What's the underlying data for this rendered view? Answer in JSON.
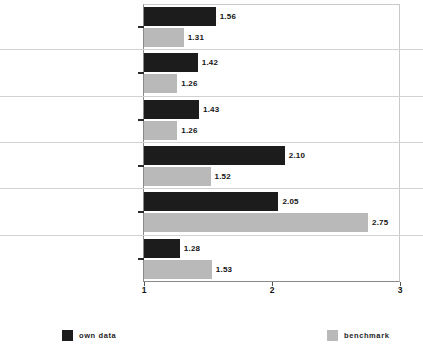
{
  "chart_data": {
    "type": "bar",
    "orientation": "horizontal",
    "title": "",
    "xlabel": "",
    "ylabel": "",
    "xlim": [
      1,
      3
    ],
    "xticks": [
      "1",
      "2",
      "3"
    ],
    "grid": false,
    "legend_position": "bottom",
    "categories": [
      "Satisfaction with the vacation",
      "Accommodation",
      "Culinary offers",
      "Sports offers",
      "Museums / sights",
      "Wellness / beauty / spa offers"
    ],
    "series": [
      {
        "name": "own data",
        "color": "#1c1c1c",
        "values": [
          1.56,
          1.42,
          1.43,
          2.1,
          2.05,
          1.28
        ],
        "labels": [
          "1.56",
          "1.42",
          "1.43",
          "2.10",
          "2.05",
          "1.28"
        ]
      },
      {
        "name": "benchmark",
        "color": "#b9b9b9",
        "values": [
          1.31,
          1.26,
          1.26,
          1.52,
          2.75,
          1.53
        ],
        "labels": [
          "1.31",
          "1.26",
          "1.26",
          "1.52",
          "2.75",
          "1.53"
        ]
      }
    ]
  },
  "legend": {
    "own_label": "own data",
    "bench_label": "benchmark"
  },
  "axis": {
    "tick_1": "1",
    "tick_2": "2",
    "tick_3": "3"
  }
}
